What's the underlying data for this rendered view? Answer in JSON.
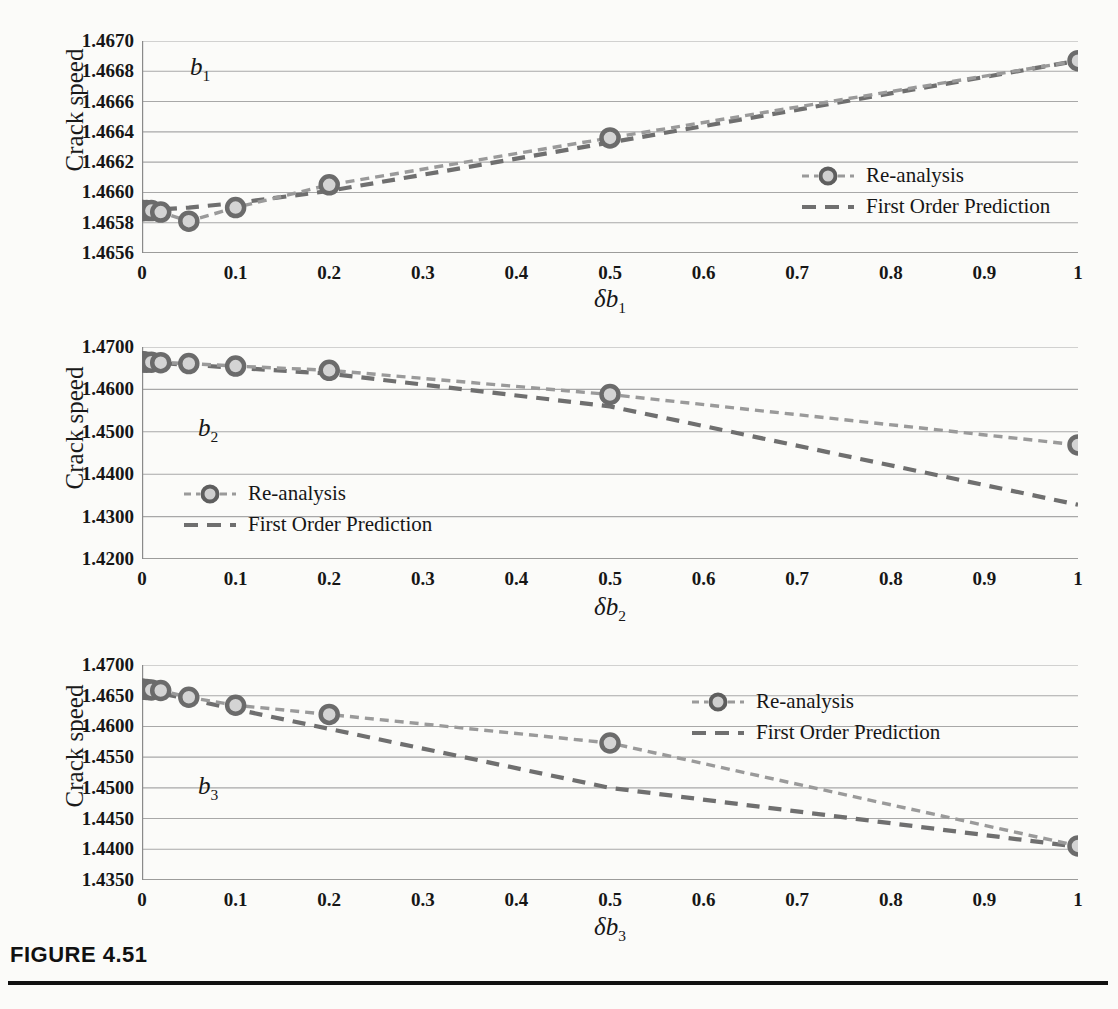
{
  "figure": {
    "caption": "FIGURE 4.51",
    "y_axis_label": "Crack speed",
    "legend": {
      "reanalysis": "Re-analysis",
      "first_order": "First Order Prediction"
    },
    "colors": {
      "reanalysis_line": "#9a9a9a",
      "reanalysis_marker_stroke": "#6b6b6b",
      "first_order_line": "#6f6f6f",
      "gridline": "#a8a8a8",
      "axis": "#8a8a8a",
      "text": "#161616",
      "background": "#fbfbf9"
    }
  },
  "chart_data": [
    {
      "type": "line",
      "title": "",
      "annotation": "b",
      "annotation_sub": "1",
      "xlabel": "δb",
      "xlabel_sub": "1",
      "ylabel": "Crack speed",
      "xlim": [
        0,
        1
      ],
      "ylim": [
        1.4656,
        1.467
      ],
      "xticks": [
        "0",
        "0.1",
        "0.2",
        "0.3",
        "0.4",
        "0.5",
        "0.6",
        "0.7",
        "0.8",
        "0.9",
        "1"
      ],
      "xtick_values": [
        0,
        0.1,
        0.2,
        0.3,
        0.4,
        0.5,
        0.6,
        0.7,
        0.8,
        0.9,
        1
      ],
      "yticks": [
        "1.4656",
        "1.4658",
        "1.4660",
        "1.4662",
        "1.4664",
        "1.4666",
        "1.4668",
        "1.4670"
      ],
      "ytick_values": [
        1.4656,
        1.4658,
        1.466,
        1.4662,
        1.4664,
        1.4666,
        1.4668,
        1.467
      ],
      "grid": true,
      "legend_position": "inside-right",
      "series": [
        {
          "name": "Re-analysis",
          "x": [
            0,
            0.001,
            0.005,
            0.01,
            0.02,
            0.05,
            0.1,
            0.2,
            0.5,
            1
          ],
          "values": [
            1.46588,
            1.46588,
            1.46588,
            1.46588,
            1.46587,
            1.46581,
            1.4659,
            1.46605,
            1.46636,
            1.46687
          ],
          "style": "dashed-with-markers"
        },
        {
          "name": "First Order Prediction",
          "x": [
            0,
            0.05,
            0.1,
            0.2,
            0.5,
            1
          ],
          "values": [
            1.46588,
            1.4659,
            1.46593,
            1.46601,
            1.46633,
            1.46687
          ],
          "style": "dashed"
        }
      ]
    },
    {
      "type": "line",
      "title": "",
      "annotation": "b",
      "annotation_sub": "2",
      "xlabel": "δb",
      "xlabel_sub": "2",
      "ylabel": "Crack speed",
      "xlim": [
        0,
        1
      ],
      "ylim": [
        1.42,
        1.47
      ],
      "xticks": [
        "0",
        "0.1",
        "0.2",
        "0.3",
        "0.4",
        "0.5",
        "0.6",
        "0.7",
        "0.8",
        "0.9",
        "1"
      ],
      "xtick_values": [
        0,
        0.1,
        0.2,
        0.3,
        0.4,
        0.5,
        0.6,
        0.7,
        0.8,
        0.9,
        1
      ],
      "yticks": [
        "1.4200",
        "1.4300",
        "1.4400",
        "1.4500",
        "1.4600",
        "1.4700"
      ],
      "ytick_values": [
        1.42,
        1.43,
        1.44,
        1.45,
        1.46,
        1.47
      ],
      "grid": true,
      "legend_position": "inside-left",
      "series": [
        {
          "name": "Re-analysis",
          "x": [
            0,
            0.001,
            0.005,
            0.01,
            0.02,
            0.05,
            0.1,
            0.2,
            0.5,
            1
          ],
          "values": [
            1.4665,
            1.4665,
            1.4664,
            1.4664,
            1.4663,
            1.4661,
            1.4655,
            1.4645,
            1.4588,
            1.4469
          ],
          "style": "dashed-with-markers"
        },
        {
          "name": "First Order Prediction",
          "x": [
            0,
            0.1,
            0.2,
            0.5,
            1
          ],
          "values": [
            1.4665,
            1.4651,
            1.4637,
            1.456,
            1.4328
          ],
          "style": "dashed"
        }
      ]
    },
    {
      "type": "line",
      "title": "",
      "annotation": "b",
      "annotation_sub": "3",
      "xlabel": "δb",
      "xlabel_sub": "3",
      "ylabel": "Crack speed",
      "xlim": [
        0,
        1
      ],
      "ylim": [
        1.435,
        1.47
      ],
      "xticks": [
        "0",
        "0.1",
        "0.2",
        "0.3",
        "0.4",
        "0.5",
        "0.6",
        "0.7",
        "0.8",
        "0.9",
        "1"
      ],
      "xtick_values": [
        0,
        0.1,
        0.2,
        0.3,
        0.4,
        0.5,
        0.6,
        0.7,
        0.8,
        0.9,
        1
      ],
      "yticks": [
        "1.4350",
        "1.4400",
        "1.4450",
        "1.4500",
        "1.4550",
        "1.4600",
        "1.4650",
        "1.4700"
      ],
      "ytick_values": [
        1.435,
        1.44,
        1.445,
        1.45,
        1.455,
        1.46,
        1.465,
        1.47
      ],
      "grid": true,
      "legend_position": "inside-right",
      "series": [
        {
          "name": "Re-analysis",
          "x": [
            0,
            0.001,
            0.005,
            0.01,
            0.02,
            0.05,
            0.1,
            0.2,
            0.5,
            1
          ],
          "values": [
            1.46605,
            1.46605,
            1.466,
            1.46595,
            1.46585,
            1.46475,
            1.46345,
            1.46195,
            1.4573,
            1.44055
          ],
          "style": "dashed-with-markers"
        },
        {
          "name": "First Order Prediction",
          "x": [
            0,
            0.1,
            0.2,
            0.5,
            1
          ],
          "values": [
            1.46605,
            1.4628,
            1.4596,
            1.45,
            1.4404
          ],
          "style": "dashed"
        }
      ]
    }
  ]
}
